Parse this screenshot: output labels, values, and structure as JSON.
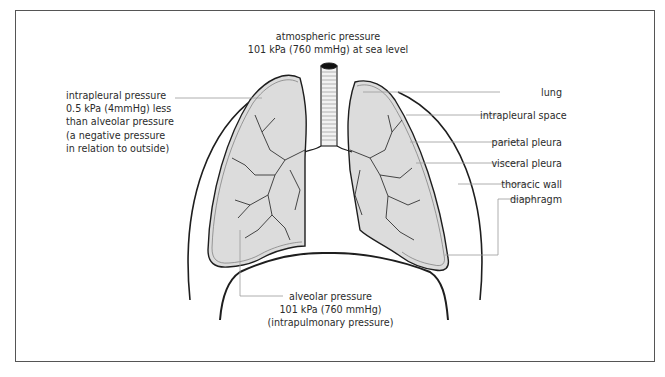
{
  "figure": {
    "top_label": {
      "line1": "atmospheric pressure",
      "line2": "101 kPa (760 mmHg) at sea level"
    },
    "left_label": {
      "line1": "intrapleural pressure",
      "line2": "0.5 kPa (4mmHg) less",
      "line3": "than alveolar pressure",
      "line4": "(a negative pressure",
      "line5": "in relation to outside)"
    },
    "bottom_label": {
      "line1": "alveolar pressure",
      "line2": "101 kPa (760 mmHg)",
      "line3": "(intrapulmonary pressure)"
    },
    "right_labels": [
      {
        "id": "lung",
        "text": "lung"
      },
      {
        "id": "intrapleural-space",
        "text": "intrapleural space"
      },
      {
        "id": "parietal-pleura",
        "text": "parietal pleura"
      },
      {
        "id": "visceral-pleura",
        "text": "visceral pleura"
      },
      {
        "id": "thoracic-wall",
        "text": "thoracic wall"
      },
      {
        "id": "diaphragm",
        "text": "diaphragm"
      }
    ],
    "colors": {
      "lung_fill": "#dcdcdc",
      "outline": "#1e1e1e",
      "leader_line": "#9a9a9a",
      "frame": "#555555"
    }
  }
}
